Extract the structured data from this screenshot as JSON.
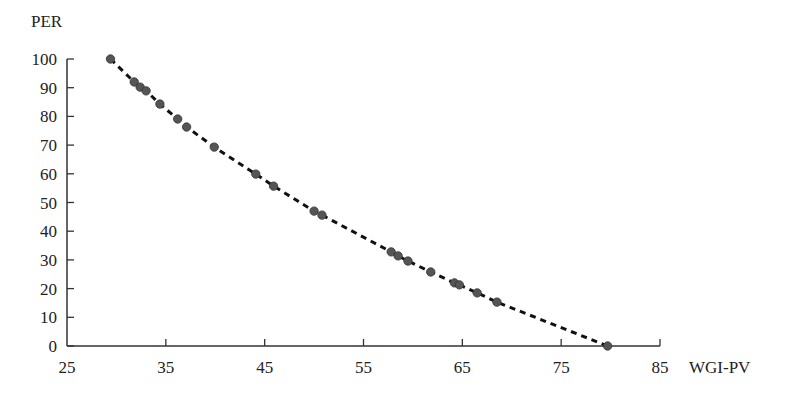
{
  "chart_data": {
    "type": "scatter",
    "title": "",
    "xlabel": "WGI-PV",
    "ylabel": "PER",
    "xlim": [
      25,
      85
    ],
    "ylim": [
      0,
      100
    ],
    "xticks": [
      25,
      35,
      45,
      55,
      65,
      75,
      85
    ],
    "yticks": [
      0,
      10,
      20,
      30,
      40,
      50,
      60,
      70,
      80,
      90,
      100
    ],
    "grid": false,
    "legend": null,
    "trendline": {
      "style": "dashed",
      "type": "polynomial fit"
    },
    "series": [
      {
        "name": "points",
        "x": [
          29.4,
          31.8,
          32.4,
          33.0,
          34.4,
          36.2,
          37.1,
          39.9,
          44.1,
          45.9,
          50.0,
          50.8,
          57.8,
          58.5,
          59.5,
          61.8,
          64.2,
          64.7,
          66.5,
          68.5,
          79.7
        ],
        "y": [
          100,
          92.0,
          90.2,
          88.9,
          84.3,
          79.1,
          76.3,
          69.3,
          59.9,
          55.7,
          47.0,
          45.6,
          32.8,
          31.4,
          29.6,
          25.8,
          22.0,
          21.3,
          18.5,
          15.3,
          0
        ]
      }
    ],
    "colors": {
      "point": "#555555",
      "line": "#111111",
      "axis": "#333333"
    }
  }
}
